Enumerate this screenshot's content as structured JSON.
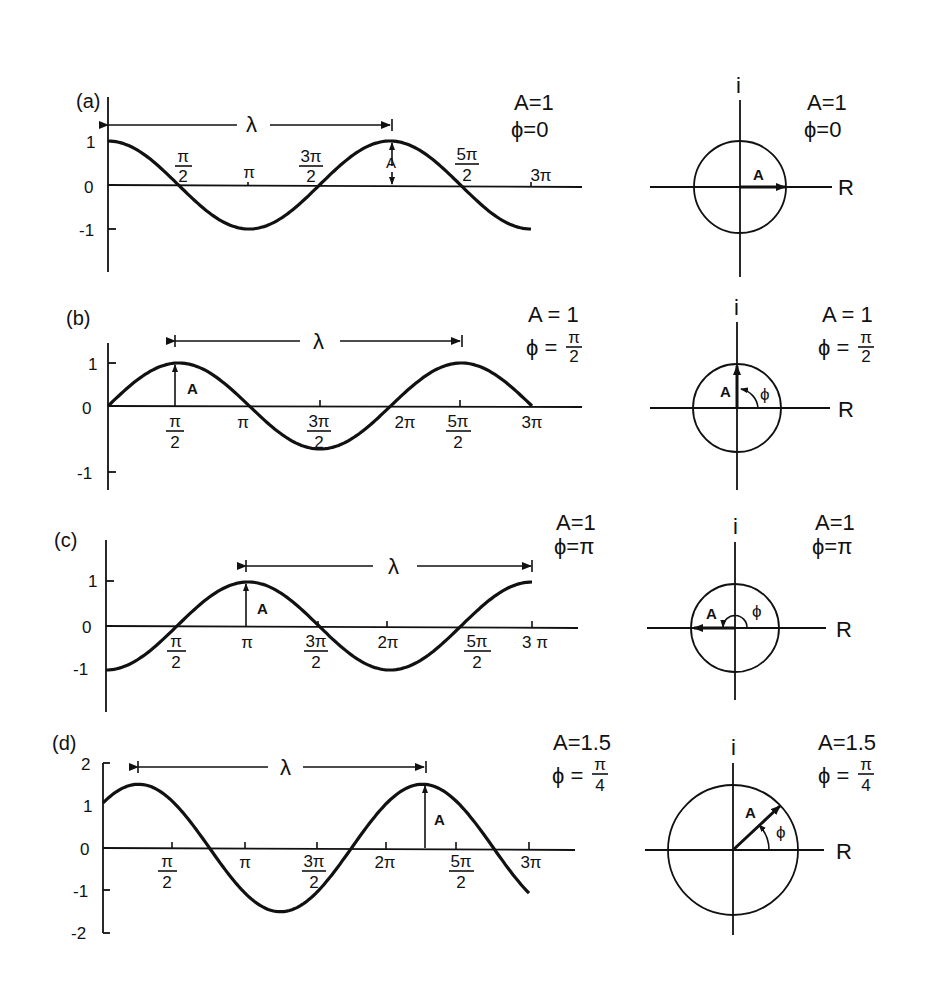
{
  "figure": {
    "panels": [
      {
        "id": "a",
        "label": "(a)",
        "amplitude_text": "A=1",
        "phase_text": "ϕ=0",
        "phase_num": "",
        "phase_den": "",
        "wavelength_symbol": "λ",
        "amplitude_marker": "A",
        "y_ticks": [
          "1",
          "0",
          "-1"
        ],
        "x_ticks": [
          {
            "num": "π",
            "den": "2"
          },
          {
            "num": "π",
            "den": ""
          },
          {
            "num": "3π",
            "den": "2"
          },
          {
            "num": "5π",
            "den": "2"
          },
          {
            "num": "3π",
            "den": ""
          }
        ],
        "phasor": {
          "real_axis": "R",
          "imag_axis": "i",
          "amplitude_text": "A=1",
          "phase_text": "ϕ=0",
          "vector_label": "A",
          "angle_label": ""
        }
      },
      {
        "id": "b",
        "label": "(b)",
        "amplitude_text": "A = 1",
        "phase_text": "ϕ =",
        "phase_num": "π",
        "phase_den": "2",
        "wavelength_symbol": "λ",
        "amplitude_marker": "A",
        "y_ticks": [
          "1",
          "0",
          "-1"
        ],
        "x_ticks": [
          {
            "num": "π",
            "den": "2"
          },
          {
            "num": "π",
            "den": ""
          },
          {
            "num": "3π",
            "den": "2"
          },
          {
            "num": "2π",
            "den": ""
          },
          {
            "num": "5π",
            "den": "2"
          },
          {
            "num": "3π",
            "den": ""
          }
        ],
        "phasor": {
          "real_axis": "R",
          "imag_axis": "i",
          "amplitude_text": "A = 1",
          "phase_text": "ϕ =",
          "phase_num": "π",
          "phase_den": "2",
          "vector_label": "A",
          "angle_label": "ϕ"
        }
      },
      {
        "id": "c",
        "label": "(c)",
        "amplitude_text": "A=1",
        "phase_text": "ϕ=π",
        "phase_num": "",
        "phase_den": "",
        "wavelength_symbol": "λ",
        "amplitude_marker": "A",
        "y_ticks": [
          "1",
          "0",
          "-1"
        ],
        "x_ticks": [
          {
            "num": "π",
            "den": "2"
          },
          {
            "num": "π",
            "den": ""
          },
          {
            "num": "3π",
            "den": "2"
          },
          {
            "num": "2π",
            "den": ""
          },
          {
            "num": "5π",
            "den": "2"
          },
          {
            "num": "3 π",
            "den": ""
          }
        ],
        "phasor": {
          "real_axis": "R",
          "imag_axis": "i",
          "amplitude_text": "A=1",
          "phase_text": "ϕ=π",
          "vector_label": "A",
          "angle_label": "ϕ"
        }
      },
      {
        "id": "d",
        "label": "(d)",
        "amplitude_text": "A=1.5",
        "phase_text": "ϕ =",
        "phase_num": "π",
        "phase_den": "4",
        "wavelength_symbol": "λ",
        "amplitude_marker": "A",
        "y_ticks": [
          "2",
          "1",
          "0",
          "-1",
          "-2"
        ],
        "x_ticks": [
          {
            "num": "π",
            "den": "2"
          },
          {
            "num": "π",
            "den": ""
          },
          {
            "num": "3π",
            "den": "2"
          },
          {
            "num": "2π",
            "den": ""
          },
          {
            "num": "5π",
            "den": "2"
          },
          {
            "num": "3π",
            "den": ""
          }
        ],
        "phasor": {
          "real_axis": "R",
          "imag_axis": "i",
          "amplitude_text": "A=1.5",
          "phase_text": "ϕ =",
          "phase_num": "π",
          "phase_den": "4",
          "vector_label": "A",
          "angle_label": "ϕ"
        }
      }
    ]
  },
  "chart_data": {
    "type": "line",
    "title": "",
    "xlabel": "",
    "ylabel": "",
    "x_range": [
      0,
      9.4248
    ],
    "x_tick_labels": [
      "π/2",
      "π",
      "3π/2",
      "2π",
      "5π/2",
      "3π"
    ],
    "series": [
      {
        "name": "(a) A=1, ϕ=0",
        "function": "1*cos(x - 0)",
        "amplitude": 1,
        "phase": 0,
        "ylim": [
          -1.5,
          1.5
        ]
      },
      {
        "name": "(b) A=1, ϕ=π/2",
        "function": "1*cos(x - π/2)",
        "amplitude": 1,
        "phase": 1.5708,
        "ylim": [
          -1.5,
          1.5
        ]
      },
      {
        "name": "(c) A=1, ϕ=π",
        "function": "1*cos(x - π)",
        "amplitude": 1,
        "phase": 3.1416,
        "ylim": [
          -1.5,
          1.5
        ]
      },
      {
        "name": "(d) A=1.5, ϕ=π/4",
        "function": "1.5*cos(x - π/4)",
        "amplitude": 1.5,
        "phase": 0.7854,
        "ylim": [
          -2,
          2
        ]
      }
    ],
    "grid": false,
    "legend": "none"
  }
}
